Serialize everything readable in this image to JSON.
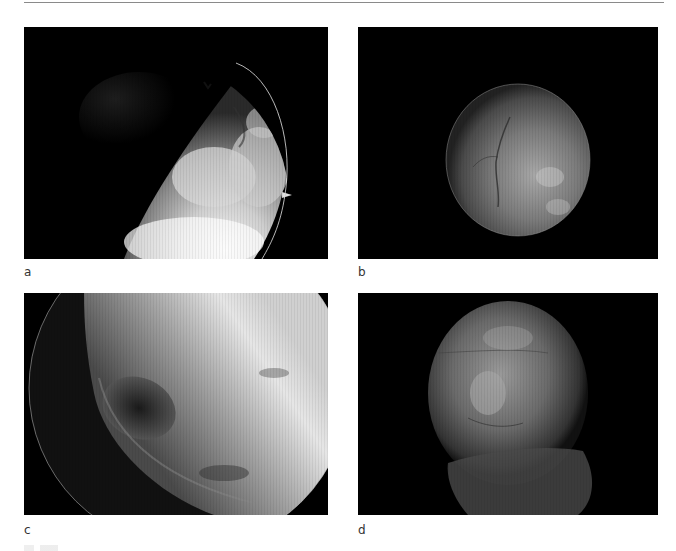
{
  "figure": {
    "panels": [
      {
        "id": "a",
        "label": "a",
        "description": "Endoscopic view: bright lobulated tissue at lower right within circular field, dark background upper left"
      },
      {
        "id": "b",
        "label": "b",
        "description": "Endoscopic view: rounded grey structure with branching vessel, centered in dark field"
      },
      {
        "id": "c",
        "label": "c",
        "description": "Endoscopic view: large bright surface filling upper field with dark oval recess lower left"
      },
      {
        "id": "d",
        "label": "d",
        "description": "Endoscopic view: rounded grey tissue mass with folded surface, dark background"
      }
    ]
  },
  "colors": {
    "background": "#ffffff",
    "panel_background": "#000000",
    "rule": "#8a8a8a",
    "label_text": "#333333"
  }
}
